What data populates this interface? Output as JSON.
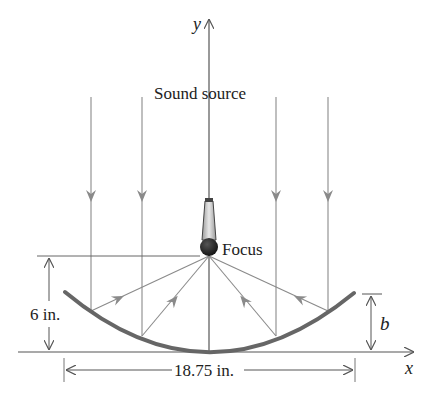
{
  "diagram": {
    "labels": {
      "y_axis": "y",
      "x_axis": "x",
      "sound_source": "Sound source",
      "focus": "Focus",
      "depth": "6 in.",
      "width": "18.75 in.",
      "height_var": "b"
    },
    "colors": {
      "axis": "#555555",
      "ray": "#8a8a8a",
      "dish": "#666666",
      "text": "#222222",
      "mic_body": "#d8d8d8",
      "mic_head": "#1e1e1e"
    }
  }
}
